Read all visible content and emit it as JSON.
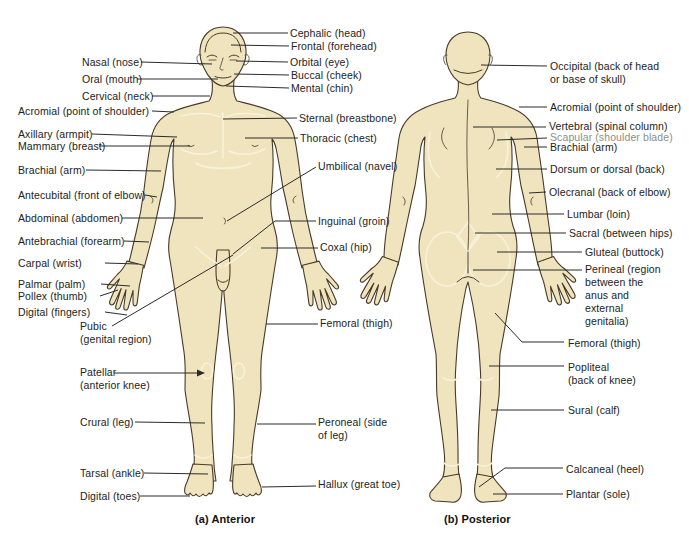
{
  "figures": {
    "anterior": {
      "caption": "(a) Anterior"
    },
    "posterior": {
      "caption": "(b) Posterior"
    }
  },
  "labels": {
    "anterior_left": [
      {
        "id": "nasal",
        "text": "Nasal (nose)"
      },
      {
        "id": "oral",
        "text": "Oral (mouth)"
      },
      {
        "id": "cervical",
        "text": "Cervical (neck)"
      },
      {
        "id": "acromial",
        "text": "Acromial (point of shoulder)"
      },
      {
        "id": "axillary",
        "text": "Axillary (armpit)"
      },
      {
        "id": "mammary",
        "text": "Mammary (breast)"
      },
      {
        "id": "brachial",
        "text": "Brachial (arm)"
      },
      {
        "id": "antecubital",
        "text": "Antecubital (front of elbow)"
      },
      {
        "id": "abdominal",
        "text": "Abdominal (abdomen)"
      },
      {
        "id": "antebrachial",
        "text": "Antebrachial (forearm)"
      },
      {
        "id": "carpal",
        "text": "Carpal (wrist)"
      },
      {
        "id": "palmar",
        "text": "Palmar (palm)"
      },
      {
        "id": "pollex",
        "text": "Pollex (thumb)"
      },
      {
        "id": "digital-fingers",
        "text": "Digital (fingers)"
      },
      {
        "id": "pubic",
        "text": "Pubic\n(genital region)"
      },
      {
        "id": "patellar",
        "text": "Patellar\n(anterior knee)"
      },
      {
        "id": "crural",
        "text": "Crural (leg)"
      },
      {
        "id": "tarsal",
        "text": "Tarsal (ankle)"
      },
      {
        "id": "digital-toes",
        "text": "Digital (toes)"
      }
    ],
    "anterior_right": [
      {
        "id": "cephalic",
        "text": "Cephalic (head)"
      },
      {
        "id": "frontal",
        "text": "Frontal (forehead)"
      },
      {
        "id": "orbital",
        "text": "Orbital (eye)"
      },
      {
        "id": "buccal",
        "text": "Buccal (cheek)"
      },
      {
        "id": "mental",
        "text": "Mental (chin)"
      },
      {
        "id": "sternal",
        "text": "Sternal (breastbone)"
      },
      {
        "id": "thoracic",
        "text": "Thoracic (chest)"
      },
      {
        "id": "umbilical",
        "text": "Umbilical (navel)"
      },
      {
        "id": "inguinal",
        "text": "Inguinal (groin)"
      },
      {
        "id": "coxal",
        "text": "Coxal (hip)"
      },
      {
        "id": "femoral",
        "text": "Femoral (thigh)"
      },
      {
        "id": "peroneal",
        "text": "Peroneal (side\nof leg)"
      },
      {
        "id": "hallux",
        "text": "Hallux (great toe)"
      }
    ],
    "posterior": [
      {
        "id": "occipital",
        "text": "Occipital (back of head\nor base of skull)"
      },
      {
        "id": "acromial",
        "text": "Acromial (point of shoulder)"
      },
      {
        "id": "vertebral",
        "text": "Vertebral (spinal column)"
      },
      {
        "id": "scapular",
        "text": "Scapular (shoulder blade)"
      },
      {
        "id": "brachial",
        "text": "Brachial (arm)"
      },
      {
        "id": "dorsum",
        "text": "Dorsum or dorsal (back)"
      },
      {
        "id": "olecranal",
        "text": "Olecranal (back of elbow)"
      },
      {
        "id": "lumbar",
        "text": "Lumbar (loin)"
      },
      {
        "id": "sacral",
        "text": "Sacral (between hips)"
      },
      {
        "id": "gluteal",
        "text": "Gluteal (buttock)"
      },
      {
        "id": "perineal",
        "text": "Perineal (region\nbetween the\nanus and\nexternal\ngenitalia)"
      },
      {
        "id": "femoral",
        "text": "Femoral (thigh)"
      },
      {
        "id": "popliteal",
        "text": "Popliteal\n(back of knee)"
      },
      {
        "id": "sural",
        "text": "Sural (calf)"
      },
      {
        "id": "calcaneal",
        "text": "Calcaneal (heel)"
      },
      {
        "id": "plantar",
        "text": "Plantar (sole)"
      }
    ]
  },
  "colors": {
    "background": "#FFFFFF",
    "body_fill": "#F0E4BE",
    "body_outline": "#473A28",
    "contour_light": "#F8F2DA",
    "label_text": "#222222",
    "scapular_gray": "#8E8E86",
    "leader_line": "#2B2B2B"
  }
}
